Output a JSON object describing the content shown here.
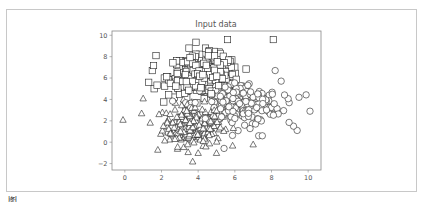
{
  "chart_data": {
    "type": "scatter",
    "title": "Input data",
    "xlabel": "",
    "ylabel": "",
    "xlim": [
      -0.7,
      10.7
    ],
    "ylim": [
      -2.6,
      10.4
    ],
    "xticks": [
      0,
      2,
      4,
      6,
      8,
      10
    ],
    "yticks": [
      -2,
      0,
      2,
      4,
      6,
      8,
      10
    ],
    "grid": false,
    "legend": null,
    "series": [
      {
        "name": "class 0",
        "marker": "triangle",
        "center": [
          3.7,
          1.6
        ],
        "spread": [
          1.0,
          1.2
        ],
        "count": 250,
        "outliers": [
          [
            -0.1,
            2.1
          ],
          [
            1.0,
            4.1
          ],
          [
            3.7,
            -1.8
          ],
          [
            7.0,
            -0.2
          ],
          [
            4.0,
            -1.0
          ],
          [
            5.0,
            -1.0
          ],
          [
            1.8,
            -0.7
          ]
        ]
      },
      {
        "name": "class 1",
        "marker": "square",
        "center": [
          4.3,
          6.2
        ],
        "spread": [
          1.2,
          1.2
        ],
        "count": 250,
        "outliers": [
          [
            5.6,
            9.6
          ],
          [
            8.1,
            9.6
          ],
          [
            1.7,
            8.1
          ],
          [
            1.3,
            5.6
          ],
          [
            1.6,
            5.0
          ],
          [
            1.5,
            6.7
          ],
          [
            3.5,
            8.8
          ],
          [
            4.4,
            8.8
          ]
        ]
      },
      {
        "name": "class 2",
        "marker": "circle",
        "center": [
          6.1,
          3.6
        ],
        "spread": [
          1.5,
          1.3
        ],
        "count": 250,
        "outliers": [
          [
            10.1,
            2.9
          ],
          [
            9.5,
            4.2
          ],
          [
            9.2,
            1.5
          ],
          [
            9.4,
            1.1
          ],
          [
            7.3,
            0.6
          ],
          [
            7.5,
            0.6
          ],
          [
            8.2,
            6.7
          ]
        ]
      }
    ]
  },
  "figure": {
    "title": "Input data",
    "caption_fragment": "图1.1"
  },
  "style": {
    "marker_stroke": "#222222",
    "marker_fill": "#ffffff",
    "axis_color": "#888888",
    "tick_label_color": "#555555",
    "frame_border": "#c8c8c8"
  }
}
